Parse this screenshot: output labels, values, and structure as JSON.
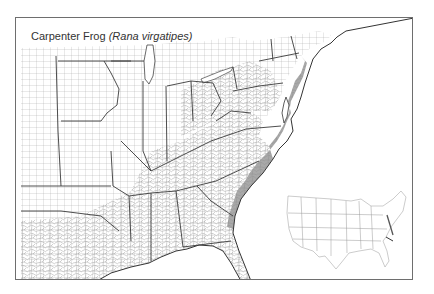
{
  "map": {
    "title": {
      "common_name": "Carpenter Frog",
      "scientific_name": "(Rana virgatipes)"
    },
    "region": "Eastern United States (county-level)",
    "range_fill_color": "#a9a9a9",
    "county_line_color": "#8a8a8a",
    "state_line_color": "#3a3a3a",
    "frame_color": "#6e6e6e",
    "inset": {
      "label": "Contiguous United States locator map"
    },
    "range_description": "Atlantic coastal plain from southern New Jersey south through Delaware, Maryland, Virginia, the Carolinas and Georgia to northeastern Florida"
  }
}
